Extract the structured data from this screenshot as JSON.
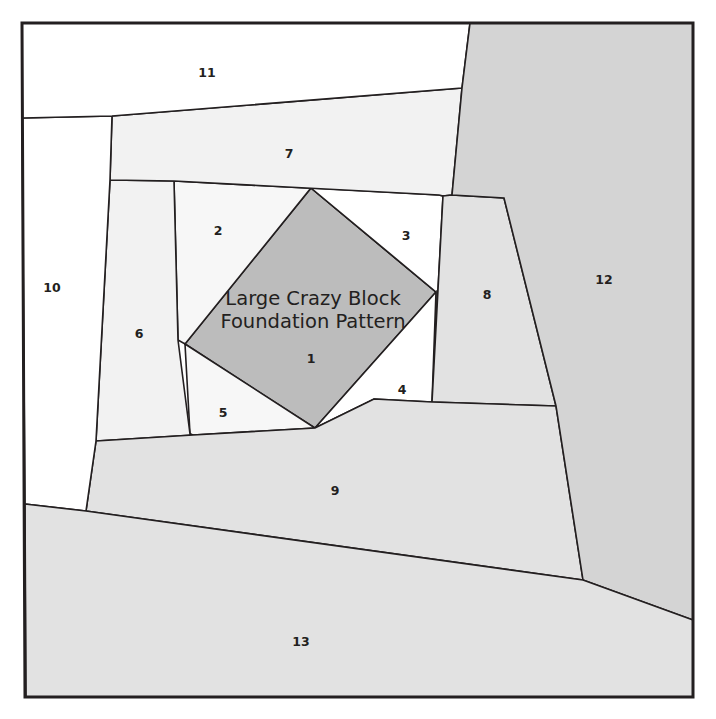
{
  "document": {
    "title_line_1": "Large Crazy Block",
    "title_line_2": "Foundation Pattern"
  },
  "colors": {
    "background": "#ffffff",
    "outline": "#231f20",
    "center_piece_fill": "#bcbcbc",
    "light_fill": "#f2f2f2",
    "lighter_fill": "#f7f7f7",
    "white_fill": "#ffffff",
    "medium_fill": "#dcdcdc",
    "gray_fill": "#d9d9d9"
  },
  "pieces": [
    {
      "number": "1",
      "fill": "#bcbcbc",
      "points": "311,188 436,292 315,428 185,344",
      "label_x": 311,
      "label_y": 359
    },
    {
      "number": "2",
      "fill": "#f7f7f7",
      "points": "174,181 439,195 436,292 311,188 185,344 178,340",
      "label_x": 218,
      "label_y": 231
    },
    {
      "number": "3",
      "fill": "#ffffff",
      "points": "439,195 443,196 432,402 436,292 311,188",
      "label_x": 406,
      "label_y": 236
    },
    {
      "number": "4",
      "fill": "#ffffff",
      "points": "436,292 432,402 374,399 315,428",
      "label_x": 402,
      "label_y": 390
    },
    {
      "number": "5",
      "fill": "#f7f7f7",
      "points": "185,344 315,428 193,435 190,434",
      "label_x": 223,
      "label_y": 413
    },
    {
      "number": "6",
      "fill": "#f2f2f2",
      "points": "110,180 174,181 178,340 190,434 193,435 96,441",
      "label_x": 139,
      "label_y": 334
    },
    {
      "number": "7",
      "fill": "#f2f2f2",
      "points": "112,116 462,88 452,195 443,196 439,195 174,181 110,180",
      "label_x": 289,
      "label_y": 154
    },
    {
      "number": "8",
      "fill": "#e2e2e2",
      "points": "452,195 504,198 556,406 432,402 443,196",
      "label_x": 487,
      "label_y": 295
    },
    {
      "number": "9",
      "fill": "#e2e2e2",
      "points": "96,441 193,435 315,428 374,399 432,402 556,406 583,580 86,511",
      "label_x": 335,
      "label_y": 491
    },
    {
      "number": "10",
      "fill": "#ffffff",
      "points": "22,118 112,116 110,180 96,441 86,511 25,504",
      "label_x": 52,
      "label_y": 288
    },
    {
      "number": "11",
      "fill": "#ffffff",
      "points": "22,23 470,23 462,88 112,116 22,118",
      "label_x": 207,
      "label_y": 73
    },
    {
      "number": "12",
      "fill": "#d4d4d4",
      "points": "470,23 693,23 693,620 583,580 556,406 504,198 452,195 462,88",
      "label_x": 604,
      "label_y": 280
    },
    {
      "number": "13",
      "fill": "#e2e2e2",
      "points": "25,504 86,511 583,580 693,620 693,697 26,697",
      "label_x": 301,
      "label_y": 642
    }
  ],
  "frame": {
    "points": "22,23 693,23 693,697 25,697"
  },
  "title_position": {
    "x": 313,
    "y1": 305,
    "y2": 328
  }
}
